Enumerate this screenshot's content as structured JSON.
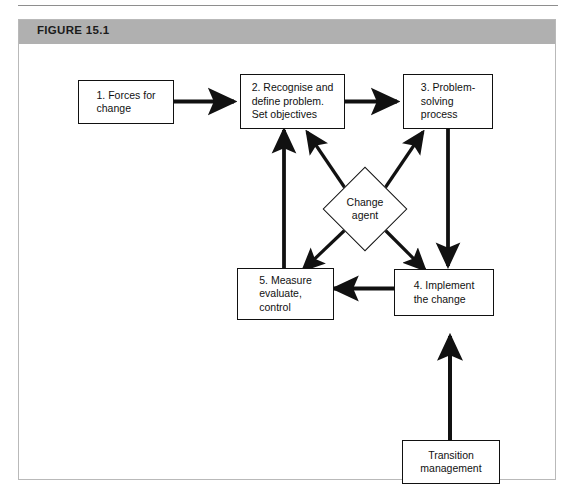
{
  "figure": {
    "label": "FIGURE 15.1"
  },
  "diagram": {
    "type": "flow-diagram",
    "nodes": [
      {
        "id": "forces",
        "shape": "rect",
        "text": "1. Forces for\n    change"
      },
      {
        "id": "recognise",
        "shape": "rect",
        "text": "2. Recognise and\n    define problem.\n    Set objectives"
      },
      {
        "id": "problem",
        "shape": "rect",
        "text": "3. Problem-\n    solving\n    process"
      },
      {
        "id": "implement",
        "shape": "rect",
        "text": "4. Implement\n    the change"
      },
      {
        "id": "measure",
        "shape": "rect",
        "text": "5. Measure\n    evaluate,\n    control"
      },
      {
        "id": "agent",
        "shape": "diamond",
        "text": "Change\nagent"
      },
      {
        "id": "transition",
        "shape": "rect",
        "text": "Transition\nmanagement"
      }
    ],
    "edges": [
      {
        "from": "forces",
        "to": "recognise",
        "direction": "right"
      },
      {
        "from": "recognise",
        "to": "problem",
        "direction": "right"
      },
      {
        "from": "problem",
        "to": "implement",
        "direction": "down"
      },
      {
        "from": "implement",
        "to": "measure",
        "direction": "left"
      },
      {
        "from": "measure",
        "to": "recognise",
        "direction": "up"
      },
      {
        "from": "agent",
        "to": "recognise",
        "direction": "up-left"
      },
      {
        "from": "agent",
        "to": "problem",
        "direction": "up-right"
      },
      {
        "from": "agent",
        "to": "measure",
        "direction": "down-left"
      },
      {
        "from": "agent",
        "to": "implement",
        "direction": "down-right"
      },
      {
        "from": "transition",
        "to": "implement",
        "direction": "up"
      }
    ]
  },
  "colors": {
    "header_band": "#b0b0b0",
    "stroke": "#111111",
    "frame": "#b9b9b9",
    "page_background": "#ffffff"
  },
  "footer": {
    "clipped_text": ""
  }
}
